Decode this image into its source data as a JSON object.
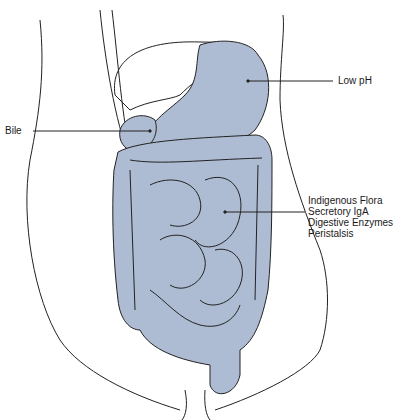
{
  "diagram": {
    "fill_color": "#aebcd3",
    "stroke_color": "#222222",
    "labels": {
      "stomach": "Low pH",
      "gallbladder": "Bile",
      "intestine": [
        "Indigenous Flora",
        "Secretory IgA",
        "Digestive Enzymes",
        "Peristalsis"
      ]
    }
  }
}
